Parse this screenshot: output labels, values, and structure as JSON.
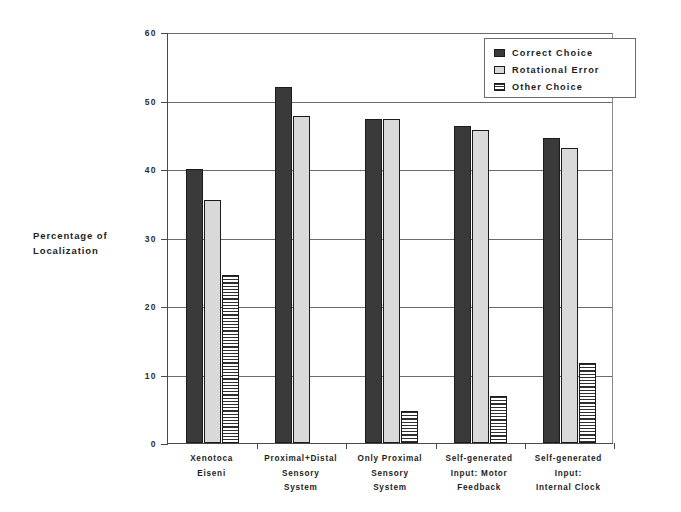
{
  "chart_data": {
    "type": "bar",
    "title": "",
    "xlabel": "",
    "ylabel": "Percentage of Localization",
    "ylim": [
      0,
      60
    ],
    "yticks": [
      0,
      10,
      20,
      30,
      40,
      50,
      60
    ],
    "ytick_labels": [
      "0",
      "10",
      "20",
      "30",
      "40",
      "50",
      "60"
    ],
    "grid": true,
    "legend_position": "top-right",
    "categories": [
      "Xenotoca Eiseni",
      "Proximal+Distal Sensory System",
      "Only Proximal Sensory System",
      "Self-generated Input: Motor Feedback",
      "Self-generated Input: Internal Clock"
    ],
    "category_lines": [
      [
        "Xenotoca",
        "Eiseni"
      ],
      [
        "Proximal+Distal",
        "Sensory",
        "System"
      ],
      [
        "Only Proximal",
        "Sensory",
        "System"
      ],
      [
        "Self-generated",
        "Input: Motor",
        "Feedback"
      ],
      [
        "Self-generated",
        "Input:",
        "Internal Clock"
      ]
    ],
    "series": [
      {
        "name": "Correct Choice",
        "color": "#3a3a3a",
        "pattern": "solid-dark",
        "values": [
          40.0,
          52.0,
          47.3,
          46.3,
          44.5
        ]
      },
      {
        "name": "Rotational Error",
        "color": "#d9d9d9",
        "pattern": "solid-light",
        "values": [
          35.5,
          47.7,
          47.3,
          45.7,
          43.0
        ]
      },
      {
        "name": "Other Choice",
        "color": "#2e2e2e",
        "pattern": "horizontal-stripes",
        "values": [
          24.5,
          0.0,
          4.7,
          6.8,
          11.7
        ]
      }
    ]
  },
  "axis": {
    "y_title_line1": "Percentage of",
    "y_title_line2": "Localization"
  },
  "legend": {
    "items": [
      {
        "label": "Correct Choice"
      },
      {
        "label": "Rotational Error"
      },
      {
        "label": "Other Choice"
      }
    ]
  }
}
